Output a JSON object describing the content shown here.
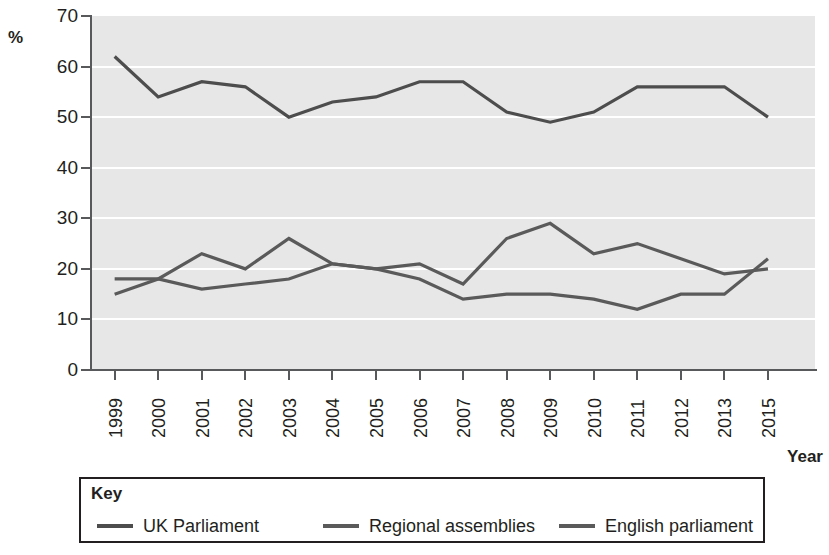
{
  "chart_data": {
    "type": "line",
    "title": "",
    "xlabel": "Year",
    "ylabel": "%",
    "ylim": [
      0,
      70
    ],
    "ytick_step": 10,
    "yticks": [
      "0",
      "10",
      "20",
      "30",
      "40",
      "50",
      "60",
      "70"
    ],
    "grid": true,
    "legend_position": "bottom",
    "legend_title": "Key",
    "categories": [
      "1999",
      "2000",
      "2001",
      "2002",
      "2003",
      "2004",
      "2005",
      "2006",
      "2007",
      "2008",
      "2009",
      "2010",
      "2011",
      "2012",
      "2013",
      "2015"
    ],
    "series": [
      {
        "name": "UK Parliament",
        "color": "#4d4d4d",
        "values": [
          62,
          54,
          57,
          56,
          50,
          53,
          54,
          57,
          57,
          51,
          49,
          51,
          56,
          56,
          56,
          50
        ]
      },
      {
        "name": "Regional assemblies",
        "color": "#5a5a5a",
        "values": [
          18,
          18,
          16,
          17,
          18,
          21,
          20,
          18,
          14,
          15,
          15,
          14,
          12,
          15,
          15,
          22
        ]
      },
      {
        "name": "English parliament",
        "color": "#5a5a5a",
        "values": [
          15,
          18,
          23,
          20,
          26,
          21,
          20,
          21,
          17,
          26,
          29,
          23,
          25,
          22,
          19,
          20
        ]
      }
    ]
  },
  "plot": {
    "background_color": "#e7e7e7",
    "gridline_color": "#ffffff",
    "axis_color": "#58595b"
  },
  "axis_titles": {
    "x": "Year",
    "y": "%"
  },
  "legend": {
    "title": "Key",
    "items": [
      {
        "label": "UK Parliament",
        "color": "#4d4d4d"
      },
      {
        "label": "Regional assemblies",
        "color": "#5a5a5a"
      },
      {
        "label": "English parliament",
        "color": "#5a5a5a"
      }
    ]
  }
}
